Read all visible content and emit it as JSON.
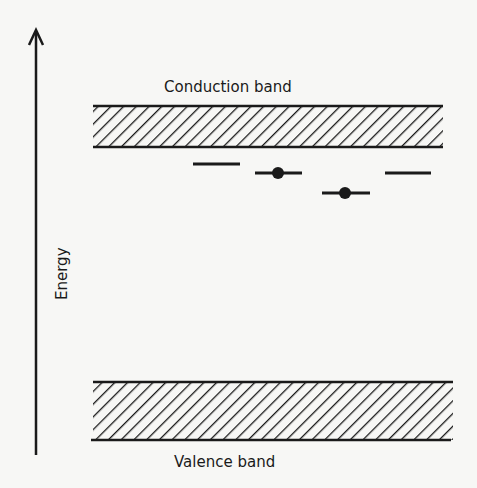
{
  "diagram": {
    "type": "energy-band-diagram",
    "axis": {
      "label": "Energy",
      "direction": "up",
      "icon": "arrow-up-icon"
    },
    "bands": [
      {
        "name": "Conduction band",
        "position": "top",
        "fill": "hatched"
      },
      {
        "name": "Valence band",
        "position": "bottom",
        "fill": "hatched"
      }
    ],
    "levels": [
      {
        "index": 1,
        "occupied": false
      },
      {
        "index": 2,
        "occupied": true
      },
      {
        "index": 3,
        "occupied": true
      },
      {
        "index": 4,
        "occupied": false
      }
    ],
    "colors": {
      "ink": "#1a1a1a",
      "background": "#f7f7f5"
    }
  }
}
